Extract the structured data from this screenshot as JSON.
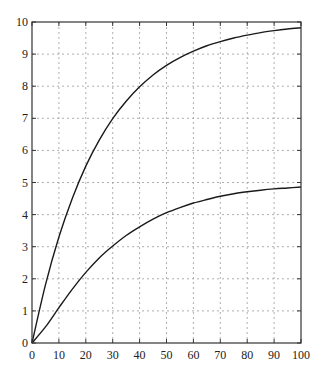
{
  "chart_data": {
    "type": "line",
    "title": "",
    "xlabel": "",
    "ylabel": "",
    "xlim": [
      0,
      100
    ],
    "ylim": [
      0,
      10
    ],
    "grid": true,
    "legend": null,
    "xticks": [
      0,
      10,
      20,
      30,
      40,
      50,
      60,
      70,
      80,
      90,
      100
    ],
    "yticks": [
      0,
      1,
      2,
      3,
      4,
      5,
      6,
      7,
      8,
      9,
      10
    ],
    "x": [
      0,
      5,
      10,
      15,
      20,
      25,
      30,
      35,
      40,
      45,
      50,
      55,
      60,
      65,
      70,
      75,
      80,
      85,
      90,
      95,
      100
    ],
    "series": [
      {
        "name": "upper curve",
        "values": [
          0,
          1.81,
          3.3,
          4.51,
          5.51,
          6.32,
          6.99,
          7.53,
          7.98,
          8.35,
          8.65,
          8.89,
          9.09,
          9.26,
          9.39,
          9.5,
          9.59,
          9.67,
          9.73,
          9.78,
          9.82
        ]
      },
      {
        "name": "lower curve",
        "values": [
          0,
          0.5,
          1.1,
          1.68,
          2.2,
          2.65,
          3.02,
          3.35,
          3.62,
          3.86,
          4.06,
          4.22,
          4.36,
          4.47,
          4.57,
          4.65,
          4.71,
          4.76,
          4.8,
          4.83,
          4.86
        ]
      }
    ],
    "colors": {
      "line": "#1a1a1a",
      "grid": "#9a9a9a",
      "axis": "#333333"
    }
  }
}
